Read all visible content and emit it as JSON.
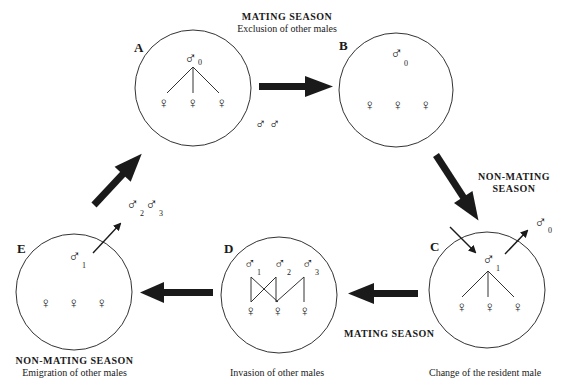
{
  "diagram": {
    "type": "cycle",
    "colors": {
      "stroke": "#1a1a1a",
      "background": "#ffffff"
    },
    "states": [
      {
        "id": "A",
        "label": "A",
        "resident_male": "0",
        "females": 3,
        "mating_links": true
      },
      {
        "id": "B",
        "label": "B",
        "resident_male": "0",
        "females": 3,
        "mating_links": false
      },
      {
        "id": "C",
        "label": "C",
        "resident_male": "1",
        "females": 3,
        "mating_links": true,
        "caption": "Change of the resident male"
      },
      {
        "id": "D",
        "label": "D",
        "males": [
          "1",
          "2",
          "3"
        ],
        "females": 3,
        "mating_links": true,
        "caption": "Invasion of other males"
      },
      {
        "id": "E",
        "label": "E",
        "resident_male": "1",
        "females": 3,
        "mating_links": false
      }
    ],
    "transitions": [
      {
        "from": "A",
        "to": "B",
        "season": "MATING SEASON",
        "description": "Exclusion of other males"
      },
      {
        "from": "B",
        "to": "C",
        "season": "NON-MATING SEASON"
      },
      {
        "from": "C",
        "to": "D",
        "season": "MATING SEASON"
      },
      {
        "from": "D",
        "to": "E",
        "season": "NON-MATING SEASON",
        "description": "Emigration of other males"
      },
      {
        "from": "E",
        "to": "A"
      }
    ],
    "outside_males": {
      "between_A_B": [
        "",
        ""
      ],
      "leaving_C": "0",
      "leaving_E": [
        "2",
        "3"
      ]
    }
  },
  "labels": {
    "top_season": "MATING SEASON",
    "top_desc": "Exclusion of other males",
    "right_season_line1": "NON-MATING",
    "right_season_line2": "SEASON",
    "bottom_mid_season": "MATING SEASON",
    "bottom_left_season": "NON-MATING SEASON",
    "bottom_left_desc": "Emigration of other males",
    "d_caption": "Invasion of other males",
    "c_caption": "Change of the resident male",
    "letter_a": "A",
    "letter_b": "B",
    "letter_c": "C",
    "letter_d": "D",
    "letter_e": "E"
  },
  "symbols": {
    "male": "♂",
    "female": "♀",
    "sub_0": "0",
    "sub_1": "1",
    "sub_2": "2",
    "sub_3": "3"
  }
}
